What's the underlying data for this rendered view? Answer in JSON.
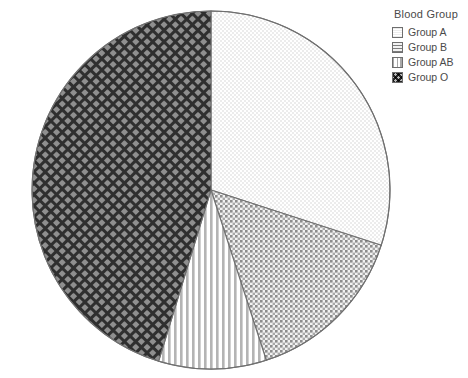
{
  "chart_data": {
    "type": "pie",
    "title": "",
    "legend_title": "Blood Group",
    "legend_position": "top-right",
    "categories": [
      "Group A",
      "Group B",
      "Group AB",
      "Group O"
    ],
    "values": [
      30,
      15,
      9.7,
      45.3
    ],
    "unit": "percent",
    "start_angle_deg": 0,
    "direction": "clockwise",
    "slices": [
      {
        "label": "Group A",
        "value": 30,
        "start_deg": 0,
        "end_deg": 108,
        "pattern": "fine-dots-light",
        "color": "#fbfbfb"
      },
      {
        "label": "Group B",
        "value": 15,
        "start_deg": 108,
        "end_deg": 162,
        "pattern": "crosshatch-medium",
        "color": "#c9c9c9"
      },
      {
        "label": "Group AB",
        "value": 9.7,
        "start_deg": 162,
        "end_deg": 197,
        "pattern": "vertical-stripes",
        "color": "#e8e8e8"
      },
      {
        "label": "Group O",
        "value": 45.3,
        "start_deg": 197,
        "end_deg": 360,
        "pattern": "crosshatch-dark",
        "color": "#4a4a4a"
      }
    ],
    "geometry": {
      "cx": 211,
      "cy": 190,
      "r": 179
    },
    "outline_color": "#707070",
    "background": "#ffffff"
  },
  "legend": {
    "title": "Blood Group",
    "items": [
      {
        "label": "Group A"
      },
      {
        "label": "Group B"
      },
      {
        "label": "Group AB"
      },
      {
        "label": "Group O"
      }
    ]
  }
}
